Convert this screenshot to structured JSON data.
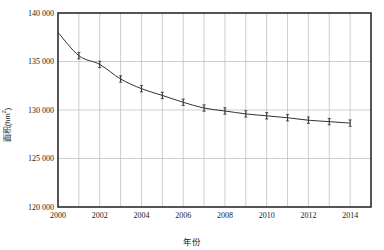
{
  "chart_data": {
    "type": "line",
    "title": "",
    "subtitle": "",
    "xlabel": "年份",
    "ylabel": "面积(hm²)",
    "ylabel_main": "面积",
    "ylabel_unit": "(hm",
    "ylabel_unit_sup": "2",
    "ylabel_unit_close": ")",
    "x": [
      2000,
      2001,
      2002,
      2003,
      2004,
      2005,
      2006,
      2007,
      2008,
      2009,
      2010,
      2011,
      2012,
      2013,
      2014
    ],
    "values": [
      138000,
      135600,
      134700,
      133200,
      132200,
      131500,
      130800,
      130200,
      129900,
      129600,
      129400,
      129200,
      128950,
      128800,
      128650
    ],
    "error_bars": [
      0,
      330,
      330,
      330,
      330,
      330,
      330,
      330,
      330,
      330,
      330,
      330,
      330,
      330,
      330
    ],
    "series": [
      {
        "name": "面积",
        "values": [
          138000,
          135600,
          134700,
          133200,
          132200,
          131500,
          130800,
          130200,
          129900,
          129600,
          129400,
          129200,
          128950,
          128800,
          128650
        ]
      }
    ],
    "xlim": [
      2000,
      2015
    ],
    "ylim": [
      120000,
      140000
    ],
    "x_ticks": [
      2000,
      2001,
      2002,
      2003,
      2004,
      2005,
      2006,
      2007,
      2008,
      2009,
      2010,
      2011,
      2012,
      2013,
      2014,
      2015
    ],
    "x_tick_labels": [
      "2000",
      "",
      "2002",
      "",
      "2004",
      "",
      "2006",
      "",
      "2008",
      "",
      "2010",
      "",
      "2012",
      "",
      "2014",
      ""
    ],
    "y_ticks": [
      120000,
      125000,
      130000,
      135000,
      140000
    ],
    "y_tick_labels": [
      "120 000",
      "125 000",
      "130 000",
      "135 000",
      "140 000"
    ],
    "grid": true,
    "grid_color": "#b9b9b9",
    "line_color": "#333333",
    "marker": "vertical-tick",
    "legend": null,
    "legend_position": "none"
  }
}
